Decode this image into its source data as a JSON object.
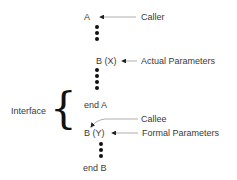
{
  "diagram": {
    "nodes": {
      "caller_proc": "A",
      "call_stmt": "B (X)",
      "end_caller": "end A",
      "callee_proc": "B (Y)",
      "end_callee": "end B"
    },
    "labels": {
      "caller": "Caller",
      "actual_params": "Actual Parameters",
      "callee": "Callee",
      "formal_params": "Formal Parameters",
      "interface": "Interface"
    },
    "colors": {
      "text": "#3a3a3a",
      "dots": "#111111",
      "arrow": "#9a9a9a"
    }
  }
}
